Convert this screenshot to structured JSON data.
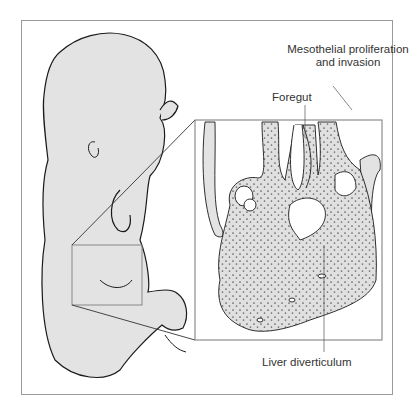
{
  "figure": {
    "labels": {
      "mesothelial": "Mesothelial proliferation",
      "mesothelial_line2": "and invasion",
      "foregut": "Foregut",
      "liver": "Liver diverticulum"
    }
  },
  "colors": {
    "fill": "#e3e3e3",
    "line": "#1a1a1a",
    "frame": "#9a9a9a",
    "dots": "#222222"
  }
}
